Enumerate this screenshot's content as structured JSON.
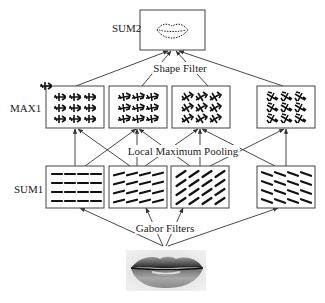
{
  "diagram": {
    "type": "hierarchical feature extraction model",
    "layers": [
      {
        "id": "sum2",
        "label": "SUM2",
        "count": 1,
        "content": "lip contour shape"
      },
      {
        "id": "max1",
        "label": "MAX1",
        "count": 4,
        "content": "pooled oriented features"
      },
      {
        "id": "sum1",
        "label": "SUM1",
        "count": 4,
        "content": "Gabor oriented responses",
        "orientations_deg": [
          0,
          -15,
          -35,
          20
        ]
      },
      {
        "id": "input",
        "label": "",
        "count": 1,
        "content": "lip image"
      }
    ],
    "connections": [
      {
        "from": "max1",
        "to": "sum2",
        "label": "Shape Filter"
      },
      {
        "from": "sum1",
        "to": "max1",
        "label": "Local Maximum Pooling"
      },
      {
        "from": "input",
        "to": "sum1",
        "label": "Gabor Filters"
      }
    ]
  },
  "labels": {
    "sum2": "SUM2",
    "max1": "MAX1",
    "sum1": "SUM1",
    "shape_filter": "Shape Filter",
    "local_max_pooling": "Local Maximum Pooling",
    "gabor_filters": "Gabor Filters"
  },
  "colors": {
    "line": "#333333",
    "box_border": "#444444",
    "glyph": "#111111",
    "background": "#ffffff"
  }
}
